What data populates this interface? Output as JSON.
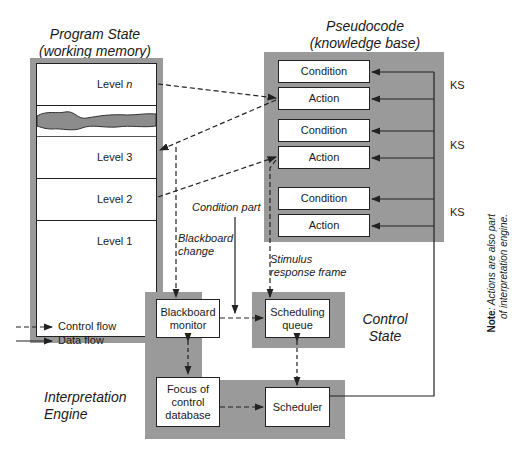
{
  "program_state": {
    "title_line1": "Program State",
    "title_line2": "(working memory)",
    "levels": [
      {
        "label": "Level ",
        "suffix": "n"
      },
      {
        "label": "Level 3"
      },
      {
        "label": "Level 2"
      },
      {
        "label": "Level 1"
      }
    ]
  },
  "knowledge_base": {
    "title_line1": "Pseudocode",
    "title_line2": "(knowledge base)",
    "knowledge_sources": [
      {
        "condition": "Condition",
        "action": "Action",
        "tag": "KS"
      },
      {
        "condition": "Condition",
        "action": "Action",
        "tag": "KS"
      },
      {
        "condition": "Condition",
        "action": "Action",
        "tag": "KS"
      }
    ]
  },
  "labels": {
    "condition_part": "Condition part",
    "blackboard_change_1": "Blackboard",
    "blackboard_change_2": "change",
    "stimulus_1": "Stimulus",
    "stimulus_2": "response frame",
    "control_state_1": "Control",
    "control_state_2": "State",
    "interp_engine_1": "Interpretation",
    "interp_engine_2": "Engine",
    "note_bold": "Note",
    "note_text_1": ": Actions are also part",
    "note_text_2": "of interpretation engine."
  },
  "engine": {
    "blackboard_monitor_1": "Blackboard",
    "blackboard_monitor_2": "monitor",
    "scheduling_queue_1": "Scheduling",
    "scheduling_queue_2": "queue",
    "focus_1": "Focus of",
    "focus_2": "control",
    "focus_3": "database",
    "scheduler": "Scheduler"
  },
  "legend": {
    "control_flow": "Control flow",
    "data_flow": "Data flow"
  },
  "colors": {
    "panel_gray": "#9a9a9a",
    "line": "#222222"
  }
}
